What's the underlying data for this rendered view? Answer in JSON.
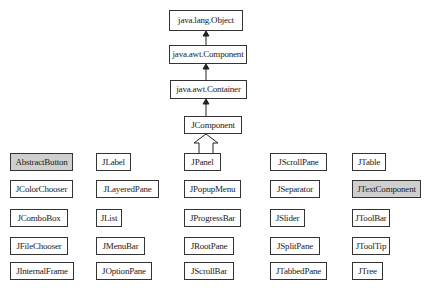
{
  "diagram": {
    "colors": {
      "border": "#333333",
      "shaded_fill": "#cfcfcf",
      "background": "#ffffff"
    },
    "chain": [
      {
        "id": "object",
        "label": "java.lang.Object"
      },
      {
        "id": "component",
        "label": "java.awt.Component"
      },
      {
        "id": "container",
        "label": "java.awt.Container"
      },
      {
        "id": "jcomponent",
        "label": "JComponent"
      }
    ],
    "subclasses": {
      "col1": [
        {
          "label": "AbstractButton",
          "shaded": true
        },
        {
          "label": "JColorChooser",
          "shaded": false
        },
        {
          "label": "JComboBox",
          "shaded": false
        },
        {
          "label": "JFileChooser",
          "shaded": false
        },
        {
          "label": "JInternalFrame",
          "shaded": false
        }
      ],
      "col2": [
        {
          "label": "JLabel",
          "shaded": false
        },
        {
          "label": "JLayeredPane",
          "shaded": false
        },
        {
          "label": "JList",
          "shaded": false
        },
        {
          "label": "JMenuBar",
          "shaded": false
        },
        {
          "label": "JOptionPane",
          "shaded": false
        }
      ],
      "col3": [
        {
          "label": "JPanel",
          "shaded": false
        },
        {
          "label": "JPopupMenu",
          "shaded": false
        },
        {
          "label": "JProgressBar",
          "shaded": false
        },
        {
          "label": "JRootPane",
          "shaded": false
        },
        {
          "label": "JScrollBar",
          "shaded": false
        }
      ],
      "col4": [
        {
          "label": "JScrollPane",
          "shaded": false
        },
        {
          "label": "JSeparator",
          "shaded": false
        },
        {
          "label": "JSlider",
          "shaded": false
        },
        {
          "label": "JSplitPane",
          "shaded": false
        },
        {
          "label": "JTabbedPane",
          "shaded": false
        }
      ],
      "col5": [
        {
          "label": "JTable",
          "shaded": false
        },
        {
          "label": "JTextComponent",
          "shaded": true
        },
        {
          "label": "JToolBar",
          "shaded": false
        },
        {
          "label": "JToolTip",
          "shaded": false
        },
        {
          "label": "JTree",
          "shaded": false
        }
      ]
    },
    "edges": [
      {
        "from": "java.awt.Component",
        "to": "java.lang.Object",
        "style": "solid-arrow"
      },
      {
        "from": "java.awt.Container",
        "to": "java.awt.Component",
        "style": "solid-arrow"
      },
      {
        "from": "JComponent",
        "to": "java.awt.Container",
        "style": "solid-arrow"
      },
      {
        "from": "all-subclasses",
        "to": "JComponent",
        "style": "hollow-inheritance-arrow"
      }
    ]
  }
}
